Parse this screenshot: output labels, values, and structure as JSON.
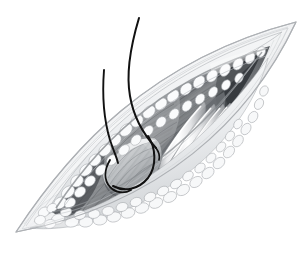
{
  "figure": {
    "kind": "medical-illustration",
    "title": "Surgical incision exposing muscle, fascia and suture threads",
    "subject": "Elliptical skin incision with retracted wound edges",
    "technique": "pencil-and-wash grayscale anatomical drawing",
    "background_color": "#ffffff",
    "canvas": {
      "width": 306,
      "height": 266
    }
  },
  "palette": {
    "background": "#ffffff",
    "skin_edge_line": "#b9bcc0",
    "skin_surface_light": "#f2f3f4",
    "skin_surface_shadow": "#d9dbdd",
    "fat_lobule_light": "#fbfbfc",
    "fat_lobule_mid": "#dcdee1",
    "fat_lobule_outline": "#a8abaf",
    "muscle_light": "#c9cbce",
    "muscle_mid": "#9b9ea2",
    "muscle_dark": "#5f6367",
    "muscle_deep_shadow": "#3d4145",
    "tendon_highlight": "#ffffff",
    "tendon_mid": "#e4e5e7",
    "tendon_shadow": "#9fa2a6",
    "wound_depth_shadow": "#6e7276",
    "suture_thread": "#111111"
  },
  "anatomy": {
    "layers": [
      {
        "id": "skin",
        "label": "Skin surface",
        "note": "Outer elliptical boundary, thin drawn contour line"
      },
      {
        "id": "dermis",
        "label": "Dermal edge",
        "note": "Narrow banded rim just inside the skin contour"
      },
      {
        "id": "subcutaneous-fat",
        "label": "Subcutaneous fat",
        "note": "Cobblestone lobules lining the whole wound rim"
      },
      {
        "id": "fascia",
        "label": "Fascia",
        "note": "Smooth pale sheet over the muscle belly"
      },
      {
        "id": "muscle",
        "label": "Muscle belly",
        "note": "Dark striated fibers running along the wound axis"
      },
      {
        "id": "tendons",
        "label": "Tendon bundles",
        "note": "Four pale glistening longitudinal cords in the wound centre"
      }
    ],
    "incision": {
      "shape": "ellipse",
      "orientation": "oblique, running lower-left to upper-right",
      "left_pole": {
        "x": 16,
        "y": 232
      },
      "right_pole": {
        "x": 296,
        "y": 22
      },
      "long_axis_deg": -36
    },
    "tendon_bundles": {
      "count": 4,
      "label": "Tendon bundles"
    },
    "sutures": {
      "count": 2,
      "color": "#111111",
      "label": "Suture threads",
      "description": "Two fine black strands rising from the wound and a looped strand encircling the raised tissue tag"
    }
  },
  "annotations": {
    "visible_labels": [],
    "visible_text": []
  }
}
